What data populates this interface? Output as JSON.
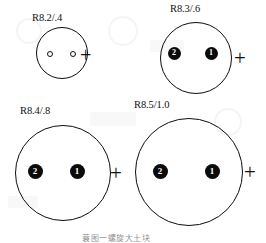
{
  "figure": {
    "caption": "蓑图一螺旋大土块",
    "plus_glyph": "+",
    "specimens": [
      {
        "id": "spec-r82",
        "label": "R8.2/.4",
        "label_x": 32,
        "label_y": 13,
        "ring": {
          "cx": 62,
          "cy": 53,
          "r": 26
        },
        "plus": {
          "x": 80,
          "y": 45,
          "size": 20
        },
        "nuclei": [
          {
            "name": "nucleus-2",
            "value": "2",
            "cx": 50,
            "cy": 54,
            "r": 3.0,
            "filled": false,
            "font_size": 5
          },
          {
            "name": "nucleus-1",
            "value": "1",
            "cx": 73,
            "cy": 54,
            "r": 3.0,
            "filled": false,
            "font_size": 5
          }
        ]
      },
      {
        "id": "spec-r83",
        "label": "R8.3/.6",
        "label_x": 170,
        "label_y": 4,
        "ring": {
          "cx": 196,
          "cy": 58,
          "r": 36
        },
        "plus": {
          "x": 234,
          "y": 48,
          "size": 21
        },
        "nuclei": [
          {
            "name": "nucleus-2",
            "value": "2",
            "cx": 174,
            "cy": 53,
            "r": 6.5,
            "filled": true,
            "font_size": 8
          },
          {
            "name": "nucleus-1",
            "value": "1",
            "cx": 211,
            "cy": 53,
            "r": 6.5,
            "filled": true,
            "font_size": 8
          }
        ]
      },
      {
        "id": "spec-r84",
        "label": "R8.4/.8",
        "label_x": 20,
        "label_y": 106,
        "ring": {
          "cx": 63,
          "cy": 173,
          "r": 48
        },
        "plus": {
          "x": 110,
          "y": 163,
          "size": 21
        },
        "nuclei": [
          {
            "name": "nucleus-2",
            "value": "2",
            "cx": 35,
            "cy": 171,
            "r": 7.5,
            "filled": true,
            "font_size": 9
          },
          {
            "name": "nucleus-1",
            "value": "1",
            "cx": 77,
            "cy": 171,
            "r": 7.5,
            "filled": true,
            "font_size": 9
          }
        ]
      },
      {
        "id": "spec-r85",
        "label": "R8.5/1.0",
        "label_x": 134,
        "label_y": 100,
        "ring": {
          "cx": 189,
          "cy": 172,
          "r": 54
        },
        "plus": {
          "x": 244,
          "y": 162,
          "size": 21
        },
        "nuclei": [
          {
            "name": "nucleus-2",
            "value": "2",
            "cx": 160,
            "cy": 171,
            "r": 7.5,
            "filled": true,
            "font_size": 9
          },
          {
            "name": "nucleus-1",
            "value": "1",
            "cx": 212,
            "cy": 171,
            "r": 7.5,
            "filled": true,
            "font_size": 9
          }
        ]
      }
    ]
  }
}
